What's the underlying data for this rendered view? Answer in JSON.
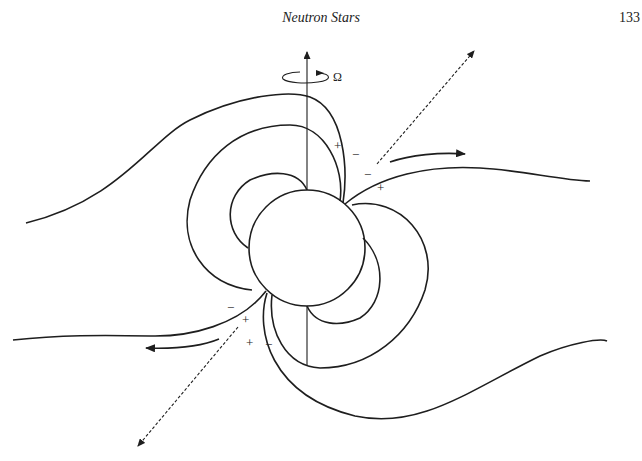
{
  "header": {
    "title": "Neutron Stars",
    "page_number": "133"
  },
  "diagram": {
    "rotation_label": "Ω",
    "charge_labels": {
      "upper_plus_1": "+",
      "upper_minus_1": "−",
      "upper_minus_2": "−",
      "upper_plus_2": "+",
      "lower_minus_1": "−",
      "lower_plus_1": "+",
      "lower_plus_2": "+",
      "lower_minus_2": "−"
    },
    "elements": [
      "rotation-axis",
      "neutron-star",
      "dipole-field-lines",
      "open-field-lines",
      "emission-beam-arrows",
      "particle-outflow-arrows"
    ],
    "colors": {
      "line": "#1e1e1e",
      "background": "#ffffff"
    }
  }
}
